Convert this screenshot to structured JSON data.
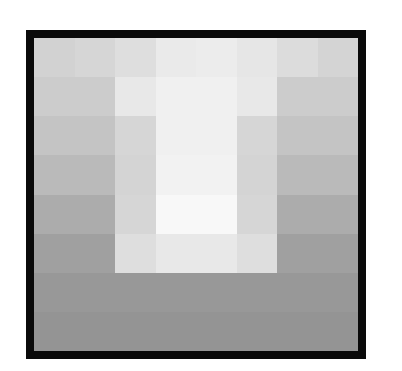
{
  "chart_data": {
    "type": "heatmap",
    "title": "",
    "xlabel": "",
    "ylabel": "",
    "rows": 8,
    "cols": 8,
    "colormap": "grayscale",
    "value_range": [
      0,
      255
    ],
    "grid": false,
    "legend": "none",
    "frame_color": "#0a0a0a",
    "values": [
      [
        210,
        214,
        222,
        234,
        236,
        230,
        220,
        212
      ],
      [
        204,
        204,
        232,
        240,
        240,
        232,
        204,
        204
      ],
      [
        196,
        196,
        214,
        240,
        240,
        214,
        196,
        196
      ],
      [
        186,
        186,
        212,
        242,
        242,
        212,
        186,
        186
      ],
      [
        172,
        172,
        214,
        248,
        248,
        214,
        172,
        172
      ],
      [
        160,
        160,
        222,
        232,
        232,
        222,
        160,
        160
      ],
      [
        152,
        152,
        152,
        152,
        152,
        152,
        152,
        152
      ],
      [
        148,
        148,
        148,
        148,
        148,
        148,
        148,
        148
      ]
    ]
  }
}
